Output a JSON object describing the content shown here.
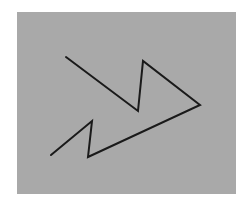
{
  "figure": {
    "background_color": "#ffffff",
    "panel": {
      "x": 17,
      "y": 12,
      "width": 219,
      "height": 182,
      "color": "#a9a9a9"
    },
    "polyline": {
      "stroke_color": "#1a1a1a",
      "stroke_width": 2,
      "points": [
        [
          66,
          57
        ],
        [
          138,
          111
        ],
        [
          143,
          61
        ],
        [
          200,
          105
        ],
        [
          88,
          157
        ],
        [
          92,
          121
        ],
        [
          51,
          155
        ]
      ]
    }
  }
}
